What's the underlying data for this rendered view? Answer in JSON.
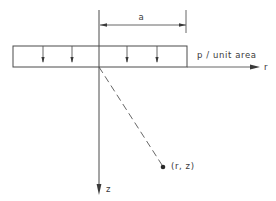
{
  "figure": {
    "type": "schematic",
    "labels": {
      "radius": "a",
      "load": "p / unit area",
      "r_axis": "r",
      "z_axis": "z",
      "point": "(r, z)"
    },
    "colors": {
      "line": "#4a4a4a",
      "text": "#3a3a3a",
      "background": "#ffffff"
    },
    "geometry": {
      "origin": [
        99,
        67
      ],
      "load_rect": {
        "x": 13,
        "y": 46,
        "width": 174,
        "height": 21
      },
      "load_arrows_x": [
        43,
        72,
        127,
        157
      ],
      "dimension_line_y": 25,
      "dimension_x_range": [
        99,
        186
      ],
      "point": [
        163,
        167
      ],
      "r_axis_end_x": 260,
      "z_axis_end_y": 195
    }
  }
}
